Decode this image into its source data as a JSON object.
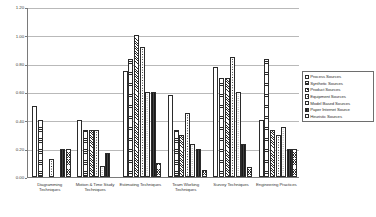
{
  "chart_data": {
    "type": "bar",
    "title": "",
    "subtitle": "",
    "xlabel": "",
    "ylabel": "",
    "ylim": [
      0.0,
      1.2
    ],
    "yticks": [
      "0.00",
      "0.20",
      "0.40",
      "0.60",
      "0.80",
      "1.00",
      "1.20"
    ],
    "ytick_values": [
      0.0,
      0.2,
      0.4,
      0.6,
      0.8,
      1.0,
      1.2
    ],
    "grid": true,
    "legend_position": "right",
    "categories": [
      "Diagramming Techniques",
      "Motion & Time Study Techniques",
      "Estimating Techniques",
      "Team Working Techniques",
      "Survey Techniques",
      "Engineering Practices"
    ],
    "series": [
      {
        "name": "Process Sources",
        "values": [
          0.5,
          0.4,
          0.75,
          0.58,
          0.78,
          0.4
        ]
      },
      {
        "name": "Synthetic Sources",
        "values": [
          0.4,
          0.33,
          0.83,
          0.33,
          0.7,
          0.83
        ]
      },
      {
        "name": "Product Sources",
        "values": [
          0.0,
          0.33,
          1.0,
          0.3,
          0.7,
          0.33
        ]
      },
      {
        "name": "Equipment Sources",
        "values": [
          0.13,
          0.33,
          0.92,
          0.45,
          0.85,
          0.3
        ]
      },
      {
        "name": "Model Based Sources",
        "values": [
          0.0,
          0.08,
          0.6,
          0.23,
          0.6,
          0.35
        ]
      },
      {
        "name": "Paper Internet Source",
        "values": [
          0.2,
          0.17,
          0.6,
          0.2,
          0.23,
          0.2
        ]
      },
      {
        "name": "Heuristic Sources",
        "values": [
          0.2,
          0.0,
          0.1,
          0.05,
          0.07,
          0.2
        ]
      }
    ]
  },
  "legend": {
    "items": [
      {
        "label": "Process Sources"
      },
      {
        "label": "Synthetic Sources"
      },
      {
        "label": "Product Sources"
      },
      {
        "label": "Equipment Sources"
      },
      {
        "label": "Model Based Sources"
      },
      {
        "label": "Paper Internet Source"
      },
      {
        "label": "Heuristic Sources"
      }
    ]
  }
}
